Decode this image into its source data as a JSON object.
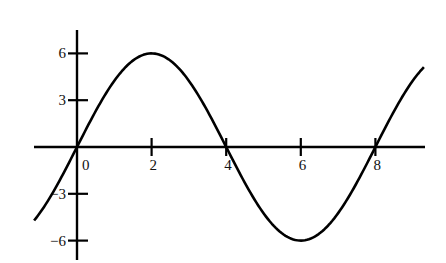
{
  "chart_data": {
    "type": "line",
    "title": "",
    "xlabel": "",
    "ylabel": "",
    "function": "y = 6 sin(pi x / 4)",
    "xlim": [
      -1.15,
      9.3
    ],
    "ylim": [
      -6.9,
      7.5
    ],
    "grid": false,
    "legend": null,
    "x_ticks": [
      0,
      2,
      4,
      6,
      8
    ],
    "x_tick_labels": [
      "0",
      "2",
      "4",
      "6",
      "8"
    ],
    "y_ticks": [
      6,
      3,
      -3,
      -6
    ],
    "y_tick_labels": [
      "6",
      "3",
      "−3",
      "−6"
    ],
    "series": [
      {
        "name": "curve",
        "color": "#000000",
        "x": [
          -1.15,
          -1,
          0,
          1,
          2,
          3,
          4,
          5,
          6,
          7,
          8,
          9,
          9.3
        ],
        "y": [
          -4.8,
          -4.24,
          0,
          4.24,
          6,
          4.24,
          0,
          -4.24,
          -6,
          -4.24,
          0,
          4.24,
          5.0
        ]
      }
    ],
    "amplitude": 6,
    "period": 8,
    "maximum": {
      "x": 2,
      "y": 6
    },
    "minimum": {
      "x": 6,
      "y": -6
    },
    "zeros": [
      0,
      4,
      8
    ]
  },
  "colors": {
    "line": "#000000",
    "background": "#ffffff"
  }
}
